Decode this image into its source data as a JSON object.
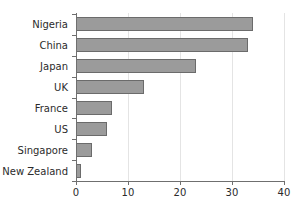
{
  "chart_data": {
    "type": "bar",
    "orientation": "horizontal",
    "title": "",
    "xlabel": "",
    "ylabel": "",
    "categories": [
      "Nigeria",
      "China",
      "Japan",
      "UK",
      "France",
      "US",
      "Singapore",
      "New Zealand"
    ],
    "values": [
      34,
      33,
      23,
      13,
      7,
      6,
      3,
      1
    ],
    "xlim": [
      0,
      40
    ],
    "xticks": [
      0,
      10,
      20,
      30,
      40
    ],
    "xtick_labels": [
      "0",
      "10",
      "20",
      "30",
      "40"
    ],
    "grid": "vertical-light",
    "legend": "none",
    "series": [
      {
        "name": "",
        "values": [
          34,
          33,
          23,
          13,
          7,
          6,
          3,
          1
        ]
      }
    ],
    "colors": {
      "bar_fill": "#9b9b9b",
      "bar_border": "#6b6b6b",
      "axis": "#6f6f6f",
      "gridline": "#e4e4e4",
      "text": "#2b2b2b",
      "background": "#ffffff"
    }
  }
}
